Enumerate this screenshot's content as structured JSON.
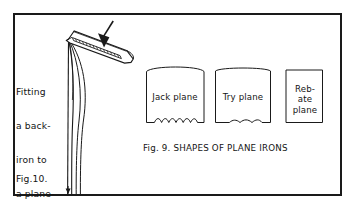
{
  "figure": {
    "width": 355,
    "height": 211,
    "background_color": "#ffffff",
    "ink_color": "#141414",
    "frame": {
      "name": "outer-border-frame",
      "x": 13,
      "y": 13,
      "width": 329,
      "height": 183,
      "stroke_color": "#1a1a1a",
      "stroke_width": 2
    }
  },
  "left_panel": {
    "caption_lines": [
      "Fitting",
      "a back-",
      "iron to",
      "a plane-",
      "iron"
    ],
    "figure_label": "Fig.10.",
    "diagram": {
      "name": "back-iron-fitting-diagram",
      "parts": [
        "back-iron",
        "plane-iron",
        "screw-slot",
        "direction-arrow"
      ],
      "arrow_direction": "down"
    }
  },
  "right_panel": {
    "caption": "Fig. 9. SHAPES OF PLANE IRONS",
    "irons": [
      {
        "label": "Jack plane",
        "label_lines": [
          "Jack plane"
        ],
        "top_edge": "convex-curved",
        "bottom_edge": "wavy-scalloped",
        "x": 146,
        "y": 66,
        "width": 58,
        "height": 58
      },
      {
        "label": "Try plane",
        "label_lines": [
          "Try plane"
        ],
        "top_edge": "slightly-curved",
        "bottom_edge": "slightly-wavy",
        "x": 215,
        "y": 66,
        "width": 56,
        "height": 58
      },
      {
        "label": "Rebate plane",
        "label_lines": [
          "Reb-",
          "ate",
          "plane"
        ],
        "top_edge": "straight",
        "bottom_edge": "straight",
        "x": 285,
        "y": 69,
        "width": 38,
        "height": 55
      }
    ]
  }
}
